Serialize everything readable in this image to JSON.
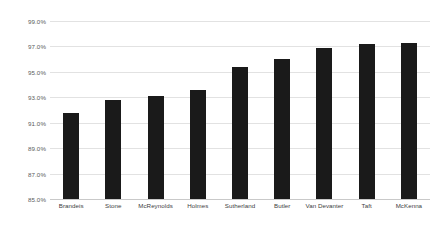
{
  "chart_data": {
    "type": "bar",
    "title": "",
    "xlabel": "",
    "ylabel": "",
    "categories": [
      "Brandeis",
      "Stone",
      "McReynolds",
      "Holmes",
      "Sutherland",
      "Butler",
      "Van Devanter",
      "Taft",
      "McKenna"
    ],
    "values": [
      91.8,
      92.8,
      93.1,
      93.6,
      95.4,
      96.0,
      96.9,
      97.2,
      97.3
    ],
    "value_labels": [
      "91.8%",
      "92.8%",
      "93.1%",
      "93.6%",
      "95.4%",
      "96.0%",
      "96.9%",
      "97.2%",
      "97.3%"
    ],
    "ylim": [
      85.0,
      99.0
    ],
    "yticks": [
      99.0,
      97.0,
      95.0,
      93.0,
      91.0,
      89.0,
      87.0,
      85.0
    ],
    "ytick_labels": [
      "99.0%",
      "97.0%",
      "95.0%",
      "93.0%",
      "91.0%",
      "89.0%",
      "87.0%",
      "85.0%"
    ],
    "grid": true,
    "legend": null,
    "legend_position": "none",
    "bar_color": "#1a1a1a",
    "grid_color": "#e2e2e2",
    "axis_color": "#c9c9c9",
    "background_color": "#ffffff",
    "tick_label_color": "#59595b",
    "category_label_color": "#404042"
  }
}
